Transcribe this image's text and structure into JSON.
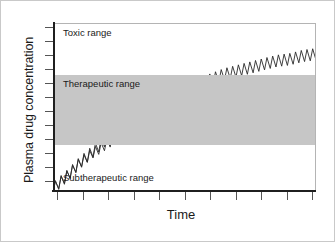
{
  "chart_data": {
    "type": "line",
    "title": "",
    "xlabel": "Time",
    "ylabel": "Plasma drug concentration",
    "grid": false,
    "legend": "none",
    "axis": {
      "x_tick_labels": [],
      "y_tick_labels": [],
      "x_tick_count": 11,
      "y_tick_count": 12,
      "xlim": [
        0,
        100
      ],
      "ylim": [
        0,
        100
      ]
    },
    "bands": [
      {
        "name": "Toxic range",
        "label": "Toxic range",
        "y_from": 70,
        "y_to": 100,
        "color": "#ffffff"
      },
      {
        "name": "Therapeutic range",
        "label": "Therapeutic range",
        "y_from": 28,
        "y_to": 70,
        "color": "#c6c6c6"
      },
      {
        "name": "Subtherapeutic range",
        "label": "Subtherapeutic range",
        "y_from": 0,
        "y_to": 28,
        "color": "#ffffff"
      }
    ],
    "series": [
      {
        "name": "Higher dosing regimen",
        "description": "Sawtooth accumulation curve rising from subtherapeutic through the therapeutic band into the toxic range",
        "x": [
          0,
          5,
          10,
          15,
          20,
          25,
          30,
          35,
          40,
          45,
          50,
          55,
          60,
          65,
          70,
          75,
          80,
          85,
          90,
          95,
          100
        ],
        "values": [
          2,
          9,
          17,
          24,
          31,
          37,
          43,
          48,
          53,
          57,
          61,
          64,
          67,
          70,
          72,
          74,
          76,
          78,
          79,
          81,
          82
        ],
        "oscillation_amplitude": 3.5,
        "doses": 46
      },
      {
        "name": "Lower dosing regimen",
        "description": "Sawtooth accumulation curve plateauing inside the therapeutic band",
        "x": [
          0,
          5,
          10,
          15,
          20,
          25,
          30,
          35,
          40,
          45,
          50,
          55,
          60,
          65,
          70,
          75,
          80,
          85,
          90,
          95,
          100
        ],
        "values": [
          2,
          9,
          17,
          23,
          28,
          33,
          37,
          41,
          44,
          46,
          48,
          50,
          51,
          52,
          53,
          54,
          55,
          56,
          56,
          57,
          57
        ],
        "oscillation_amplitude": 3.0,
        "doses": 46
      }
    ]
  },
  "figure": {
    "y_axis_title": "Plasma drug concentration",
    "x_axis_title": "Time",
    "zone_toxic": "Toxic range",
    "zone_therapeutic": "Therapeutic range",
    "zone_subtherapeutic": "Subtherapeutic range"
  }
}
